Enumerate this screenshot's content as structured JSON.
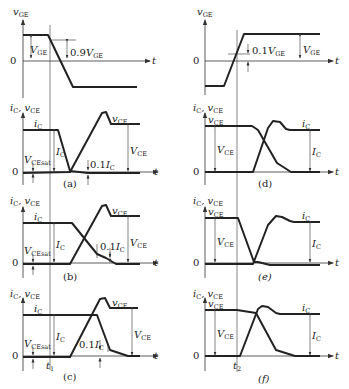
{
  "figure": {
    "type": "IGBT switching waveforms",
    "time_axis_label": "t",
    "zero_label": "0",
    "top_left": {
      "ylabel": "v",
      "ylabel_sub": "GE",
      "annotation_1": "V",
      "annotation_1_sub": "GE",
      "annotation_2_prefix": "0.9",
      "annotation_2": "V",
      "annotation_2_sub": "GE"
    },
    "top_right": {
      "ylabel": "v",
      "ylabel_sub": "GE",
      "annotation_1_prefix": "0.1",
      "annotation_1": "V",
      "annotation_1_sub": "GE",
      "annotation_2": "V",
      "annotation_2_sub": "GE"
    },
    "panels": [
      {
        "id": "a",
        "caption": "(a)",
        "ylabel": "i",
        "ylabel_sub": "C",
        "ylabel2": "v",
        "ylabel2_sub": "CE",
        "ic_label": "i",
        "ic_sub": "C",
        "vce_label": "v",
        "vce_sub": "CE",
        "vcesat": "V",
        "vcesat_sub": "CEsat",
        "Ic": "I",
        "Ic_sub": "C",
        "tenth_prefix": "0.1",
        "tenth": "I",
        "tenth_sub": "C",
        "VCE": "V",
        "VCE_sub": "CE"
      },
      {
        "id": "b",
        "caption": "(b)",
        "ylabel": "i",
        "ylabel_sub": "C",
        "ylabel2": "v",
        "ylabel2_sub": "CE",
        "ic_label": "i",
        "ic_sub": "C",
        "vce_label": "v",
        "vce_sub": "CE",
        "vcesat": "V",
        "vcesat_sub": "CEsat",
        "Ic": "I",
        "Ic_sub": "C",
        "tenth_prefix": "0.1",
        "tenth": "I",
        "tenth_sub": "C",
        "VCE": "V",
        "VCE_sub": "CE"
      },
      {
        "id": "c",
        "caption": "(c)",
        "ylabel": "i",
        "ylabel_sub": "C",
        "ylabel2": "v",
        "ylabel2_sub": "CE",
        "ic_label": "i",
        "ic_sub": "C",
        "vce_label": "v",
        "vce_sub": "CE",
        "vcesat": "V",
        "vcesat_sub": "CEsat",
        "Ic": "I",
        "Ic_sub": "C",
        "tenth_prefix": "0.1",
        "tenth": "I",
        "tenth_sub": "C",
        "VCE": "V",
        "VCE_sub": "CE",
        "time_marker": "t",
        "time_marker_sub": "1"
      },
      {
        "id": "d",
        "caption": "(d)",
        "ylabel": "i",
        "ylabel_sub": "C",
        "ylabel2": "v",
        "ylabel2_sub": "CE",
        "vce_label": "v",
        "vce_sub": "CE",
        "ic_label": "i",
        "ic_sub": "C",
        "VCE": "V",
        "VCE_sub": "CE",
        "Ic": "I",
        "Ic_sub": "C"
      },
      {
        "id": "e",
        "caption": "(e)",
        "ylabel": "i",
        "ylabel_sub": "C",
        "ylabel2": "v",
        "ylabel2_sub": "CE",
        "vce_label": "v",
        "vce_sub": "CE",
        "ic_label": "i",
        "ic_sub": "C",
        "VCE": "V",
        "VCE_sub": "CE",
        "Ic": "I",
        "Ic_sub": "C"
      },
      {
        "id": "f",
        "caption": "(f)",
        "ylabel": "i",
        "ylabel_sub": "C",
        "ylabel2": "v",
        "ylabel2_sub": "CE",
        "vce_label": "v",
        "vce_sub": "CE",
        "ic_label": "i",
        "ic_sub": "C",
        "VCE": "V",
        "VCE_sub": "CE",
        "Ic": "I",
        "Ic_sub": "C",
        "time_marker": "t",
        "time_marker_sub": "2"
      }
    ]
  }
}
